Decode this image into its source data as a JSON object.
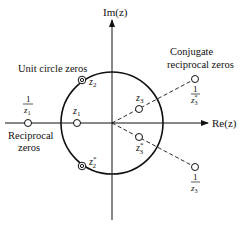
{
  "diagram": {
    "type": "pole-zero plot (z-plane)",
    "axes": {
      "imaginary_label": "Im(z)",
      "real_label": "Re(z)"
    },
    "annotations": {
      "unit_circle_zeros": "Unit circle zeros",
      "conjugate_reciprocal_line1": "Conjugate",
      "conjugate_reciprocal_line2": "reciprocal zeros",
      "reciprocal_line1": "Reciprocal",
      "reciprocal_line2": "zeros"
    },
    "zeros": [
      {
        "id": "z1",
        "label": "z",
        "sub": "1",
        "sup": "",
        "type": "single"
      },
      {
        "id": "inv_z1",
        "numerator": "1",
        "label": "z",
        "sub": "1",
        "sup": "",
        "type": "single"
      },
      {
        "id": "z2",
        "label": "z",
        "sub": "2",
        "sup": "",
        "type": "double-ring"
      },
      {
        "id": "z2_conj",
        "label": "z",
        "sub": "2",
        "sup": "*",
        "type": "double-ring"
      },
      {
        "id": "z3",
        "label": "z",
        "sub": "3",
        "sup": "",
        "type": "single"
      },
      {
        "id": "z3_conj",
        "label": "z",
        "sub": "3",
        "sup": "*",
        "type": "single"
      },
      {
        "id": "inv_z3_conj",
        "numerator": "1",
        "label": "z",
        "sub": "3",
        "sup": "*",
        "type": "single"
      },
      {
        "id": "inv_z3",
        "numerator": "1",
        "label": "z",
        "sub": "3",
        "sup": "",
        "type": "single"
      }
    ],
    "colors": {
      "stroke": "#111111",
      "background": "#ffffff"
    }
  }
}
